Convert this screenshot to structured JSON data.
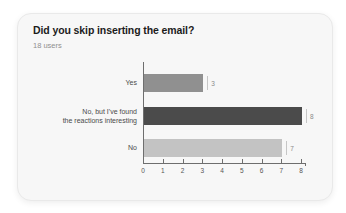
{
  "card": {
    "title": "Did you skip inserting the email?",
    "subtitle": "18 users"
  },
  "chart_data": {
    "type": "bar",
    "orientation": "horizontal",
    "title": "Did you skip inserting the email?",
    "subtitle": "18 users",
    "categories": [
      "Yes",
      "No, but I've found the reactions interesting",
      "No"
    ],
    "categories_display": [
      "Yes",
      "No, but I've found\nthe reactions interesting",
      "No"
    ],
    "values": [
      3,
      8,
      7
    ],
    "value_labels": [
      "3",
      "8",
      "7"
    ],
    "bar_colors": [
      "#909090",
      "#4b4b4b",
      "#c3c3c3"
    ],
    "xlim": [
      0,
      8
    ],
    "x_ticks": [
      0,
      1,
      2,
      3,
      4,
      5,
      6,
      7,
      8
    ],
    "xlabel": "",
    "ylabel": "",
    "grid": false,
    "legend": false
  },
  "colors": {
    "page_bg": "#ffffff",
    "card_bg": "#f7f7f7",
    "card_border": "#e9e9e9",
    "title_text": "#1c1c1c",
    "subtitle_text": "#8f8f8f",
    "category_text": "#4a4a4a",
    "axis_line": "#6e6e6e",
    "tick_text": "#555555",
    "value_text": "#8a8a8a",
    "value_marker": "#c6c6c6"
  }
}
